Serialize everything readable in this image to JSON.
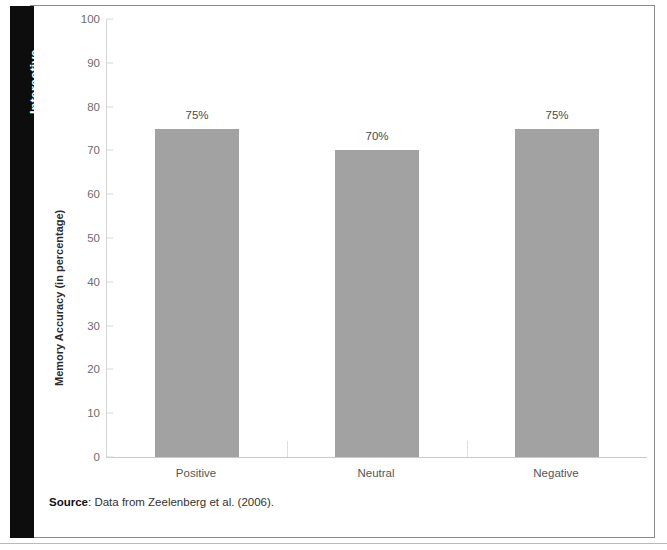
{
  "sidebar": {
    "tab_label": "Interactive"
  },
  "figure": {
    "source_prefix": "Source",
    "source_separator": ": ",
    "source_text": "Data from Zeelenberg et al. (2006)."
  },
  "chart_data": {
    "type": "bar",
    "title": "",
    "subtitle": "",
    "xlabel": "",
    "ylabel": "Memory Accuracy (in percentage)",
    "categories": [
      "Positive",
      "Neutral",
      "Negative"
    ],
    "values": [
      75,
      70,
      75
    ],
    "value_labels": [
      "75%",
      "70%",
      "75%"
    ],
    "ylim": [
      0,
      100
    ],
    "yticks": [
      100,
      90,
      80,
      70,
      60,
      50,
      40,
      30,
      20,
      10,
      0
    ],
    "ytick_labels": [
      "100",
      "90",
      "80",
      "70",
      "60",
      "50",
      "40",
      "30",
      "20",
      "10",
      "0"
    ],
    "grid": false,
    "legend": null,
    "legend_position": "none",
    "bar_color": "#a2a2a2",
    "axis_color": "#d4d4d4",
    "text_color": "#565656"
  }
}
